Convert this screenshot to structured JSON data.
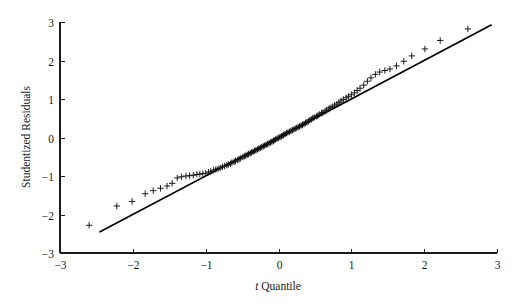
{
  "chart_data": {
    "type": "scatter",
    "title": "",
    "subtitle": "",
    "xlabel_italic": "t",
    "xlabel": " Quantile",
    "xlabel_full": "t Quantile",
    "ylabel": "Studentized Residuals",
    "xlim": [
      -3,
      3
    ],
    "ylim": [
      -3,
      3
    ],
    "xticks": [
      -3,
      -2,
      -1,
      0,
      1,
      2,
      3
    ],
    "xticklabels": [
      "−3",
      "−2",
      "−1",
      "0",
      "1",
      "2",
      "3"
    ],
    "yticks": [
      -3,
      -2,
      -1,
      0,
      1,
      2,
      3
    ],
    "yticklabels": [
      "−3",
      "−2",
      "−1",
      "0",
      "1",
      "2",
      "3"
    ],
    "grid": false,
    "legend": null,
    "marker_style": "plus",
    "marker_color": "#111111",
    "reference_line": {
      "label": "identity line",
      "x": [
        -2.45,
        2.92
      ],
      "y": [
        -2.45,
        2.92
      ],
      "slope": 1.0,
      "intercept": 0.0,
      "color": "#000000"
    },
    "series": [
      {
        "name": "studentized residuals vs t quantiles",
        "x": [
          -2.6,
          -2.22,
          -2.01,
          -1.83,
          -1.72,
          -1.62,
          -1.53,
          -1.46,
          -1.39,
          -1.33,
          -1.27,
          -1.22,
          -1.17,
          -1.12,
          -1.08,
          -1.04,
          -1.0,
          -0.96,
          -0.93,
          -0.89,
          -0.86,
          -0.83,
          -0.8,
          -0.77,
          -0.74,
          -0.71,
          -0.69,
          -0.66,
          -0.64,
          -0.61,
          -0.59,
          -0.56,
          -0.54,
          -0.52,
          -0.49,
          -0.47,
          -0.45,
          -0.43,
          -0.41,
          -0.39,
          -0.37,
          -0.35,
          -0.33,
          -0.31,
          -0.29,
          -0.27,
          -0.25,
          -0.23,
          -0.21,
          -0.19,
          -0.17,
          -0.15,
          -0.13,
          -0.11,
          -0.09,
          -0.07,
          -0.06,
          -0.04,
          -0.02,
          0.0,
          0.02,
          0.04,
          0.06,
          0.07,
          0.09,
          0.11,
          0.13,
          0.15,
          0.17,
          0.19,
          0.21,
          0.23,
          0.25,
          0.27,
          0.29,
          0.31,
          0.33,
          0.35,
          0.37,
          0.39,
          0.41,
          0.43,
          0.45,
          0.47,
          0.49,
          0.52,
          0.54,
          0.56,
          0.59,
          0.61,
          0.64,
          0.66,
          0.69,
          0.71,
          0.74,
          0.77,
          0.8,
          0.83,
          0.86,
          0.89,
          0.93,
          0.96,
          1.0,
          1.04,
          1.08,
          1.12,
          1.17,
          1.22,
          1.27,
          1.33,
          1.39,
          1.46,
          1.53,
          1.62,
          1.72,
          1.83,
          2.01,
          2.22,
          2.6
        ],
        "y": [
          -2.28,
          -1.78,
          -1.66,
          -1.46,
          -1.38,
          -1.32,
          -1.26,
          -1.19,
          -1.05,
          -1.02,
          -1.0,
          -0.99,
          -0.98,
          -0.96,
          -0.95,
          -0.94,
          -0.93,
          -0.9,
          -0.88,
          -0.85,
          -0.83,
          -0.81,
          -0.79,
          -0.76,
          -0.74,
          -0.72,
          -0.7,
          -0.68,
          -0.65,
          -0.63,
          -0.61,
          -0.58,
          -0.56,
          -0.54,
          -0.51,
          -0.49,
          -0.47,
          -0.45,
          -0.43,
          -0.41,
          -0.39,
          -0.37,
          -0.35,
          -0.33,
          -0.31,
          -0.29,
          -0.27,
          -0.25,
          -0.23,
          -0.21,
          -0.19,
          -0.17,
          -0.15,
          -0.13,
          -0.11,
          -0.09,
          -0.07,
          -0.05,
          -0.03,
          -0.01,
          0.01,
          0.03,
          0.05,
          0.07,
          0.09,
          0.11,
          0.13,
          0.15,
          0.17,
          0.19,
          0.21,
          0.23,
          0.25,
          0.27,
          0.29,
          0.31,
          0.33,
          0.35,
          0.38,
          0.4,
          0.42,
          0.45,
          0.47,
          0.5,
          0.52,
          0.55,
          0.57,
          0.6,
          0.63,
          0.65,
          0.68,
          0.71,
          0.74,
          0.77,
          0.8,
          0.84,
          0.87,
          0.91,
          0.95,
          0.99,
          1.03,
          1.07,
          1.11,
          1.16,
          1.22,
          1.28,
          1.36,
          1.46,
          1.55,
          1.64,
          1.7,
          1.74,
          1.78,
          1.86,
          1.98,
          2.12,
          2.3,
          2.52,
          2.82
        ]
      }
    ],
    "annotations": []
  },
  "figure": {
    "background_color": "#ffffff",
    "axis_color": "#1a1a1a",
    "plot_left_px": 60,
    "plot_right_px": 497,
    "plot_top_px": 22,
    "plot_bottom_px": 253
  }
}
